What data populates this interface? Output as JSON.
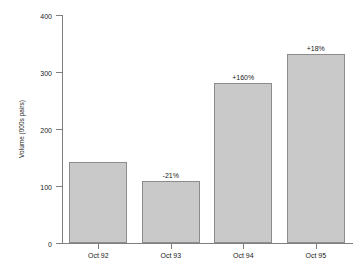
{
  "chart_data": {
    "type": "bar",
    "title": "",
    "xlabel": "",
    "ylabel": "Volume (000s pairs)",
    "categories": [
      "Oct 92",
      "Oct 93",
      "Oct 94",
      "Oct 95"
    ],
    "values": [
      142,
      109,
      281,
      332
    ],
    "point_labels": [
      "",
      "-21%",
      "+160%",
      "+18%"
    ],
    "ylim": [
      0,
      400
    ],
    "yticks": [
      0,
      100,
      200,
      300,
      400
    ],
    "ytick_labels": [
      "0",
      "100",
      "200",
      "300",
      "400"
    ],
    "grid": false,
    "legend": false,
    "bar_fill_color": "#c9c9c9",
    "bar_edge_color": "#8c8c8c",
    "axis_color": "#808080",
    "background_color": "#ffffff"
  }
}
